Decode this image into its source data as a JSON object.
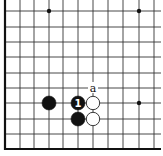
{
  "diagram": {
    "type": "go-board-fragment",
    "corner": "bottom-left",
    "grid": {
      "columns_x": [
        5,
        20,
        34,
        49,
        63,
        78,
        93,
        108,
        123,
        139,
        154
      ],
      "rows_y": [
        11,
        27,
        42,
        57,
        73,
        88,
        103,
        119,
        134,
        149
      ],
      "line_color": "#333333",
      "edge_color": "#111111"
    },
    "star_points": [
      {
        "col": 3,
        "row": 0
      },
      {
        "col": 9,
        "row": 0
      },
      {
        "col": 9,
        "row": 6
      }
    ],
    "stones": [
      {
        "color": "black",
        "col": 3,
        "row": 6,
        "label": ""
      },
      {
        "color": "black",
        "col": 5,
        "row": 6,
        "label": "1"
      },
      {
        "color": "white",
        "col": 6,
        "row": 6,
        "label": ""
      },
      {
        "color": "black",
        "col": 5,
        "row": 7,
        "label": ""
      },
      {
        "color": "white",
        "col": 6,
        "row": 7,
        "label": ""
      }
    ],
    "labels": [
      {
        "text": "a",
        "col": 6,
        "row": 5
      }
    ]
  }
}
